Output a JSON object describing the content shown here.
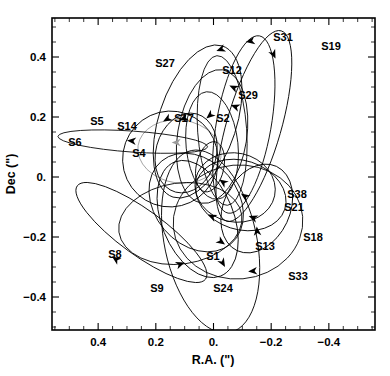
{
  "figure": {
    "type": "orbit-plot",
    "background": "#ffffff",
    "line_color": "#000000",
    "grey_line_color": "#8a8a8a"
  },
  "axes": {
    "x": {
      "label": "R.A. (\")",
      "ticks": [
        "0.4",
        "0.2",
        "0.",
        "-0.2",
        "-0.4"
      ],
      "tick_values": [
        0.4,
        0.2,
        0.0,
        -0.2,
        -0.4
      ],
      "range": [
        0.56,
        -0.56
      ],
      "reversed": true,
      "minor_tick_step": 0.05
    },
    "y": {
      "label": "Dec (\")",
      "ticks": [
        "0.4",
        "0.2",
        "0.",
        "-0.2",
        "-0.4"
      ],
      "tick_values": [
        0.4,
        0.2,
        0.0,
        -0.2,
        -0.4
      ],
      "range": [
        -0.51,
        0.53
      ],
      "minor_tick_step": 0.05
    }
  },
  "chart_data": {
    "type": "scatter",
    "title": "",
    "xlabel": "R.A. (\")",
    "ylabel": "Dec (\")",
    "xlim": [
      0.56,
      -0.56
    ],
    "ylim": [
      -0.51,
      0.53
    ],
    "grid": false,
    "legend": "none",
    "focus": {
      "ra": 0.0,
      "dec": 0.0
    },
    "orbits": [
      {
        "name": "S1",
        "cx": 0.055,
        "cy": -0.14,
        "rx": 0.125,
        "ry": 0.205,
        "rot": -22,
        "color": "#000000",
        "arrow": {
          "x": 0.02,
          "y": -0.125,
          "angle": 205
        }
      },
      {
        "name": "S2",
        "cx": 0.012,
        "cy": 0.034,
        "rx": 0.048,
        "ry": 0.085,
        "rot": 12,
        "color": "#000000",
        "arrow": {
          "x": -0.02,
          "y": -0.008,
          "angle": 215
        }
      },
      {
        "name": "S4",
        "cx": 0.118,
        "cy": 0.085,
        "rx": 0.145,
        "ry": 0.105,
        "rot": 8,
        "color": "#9a9a9a",
        "arrow": {
          "x": 0.145,
          "y": 0.115,
          "angle": 180
        }
      },
      {
        "name": "S5",
        "cx": 0.15,
        "cy": 0.06,
        "rx": 0.165,
        "ry": 0.16,
        "rot": 20,
        "color": "#000000",
        "arrow": {
          "x": 0.175,
          "y": 0.185,
          "angle": 150
        }
      },
      {
        "name": "S6",
        "cx": 0.28,
        "cy": 0.118,
        "rx": 0.26,
        "ry": 0.035,
        "rot": 4,
        "color": "#000000",
        "arrow": {
          "x": 0.3,
          "y": 0.122,
          "angle": 185
        }
      },
      {
        "name": "S8",
        "cx": 0.25,
        "cy": -0.185,
        "rx": 0.275,
        "ry": 0.075,
        "rot": 36,
        "color": "#000000",
        "arrow": {
          "x": 0.352,
          "y": -0.265,
          "angle": 215
        }
      },
      {
        "name": "S9",
        "cx": 0.115,
        "cy": -0.155,
        "rx": 0.215,
        "ry": 0.135,
        "rot": -8,
        "color": "#000000",
        "arrow": {
          "x": 0.1,
          "y": -0.285,
          "angle": 340
        }
      },
      {
        "name": "S12",
        "cx": 0.005,
        "cy": 0.135,
        "rx": 0.12,
        "ry": 0.225,
        "rot": 9,
        "color": "#000000",
        "arrow": {
          "x": -0.055,
          "y": 0.305,
          "angle": 205
        }
      },
      {
        "name": "S13",
        "cx": 0.06,
        "cy": -0.085,
        "rx": 0.145,
        "ry": 0.18,
        "rot": -40,
        "color": "#000000",
        "arrow": {
          "x": -0.04,
          "y": -0.225,
          "angle": 35
        }
      },
      {
        "name": "S14",
        "cx": 0.095,
        "cy": 0.08,
        "rx": 0.105,
        "ry": 0.135,
        "rot": 15,
        "color": "#000000",
        "arrow": {
          "x": 0.118,
          "y": 0.19,
          "angle": 160
        }
      },
      {
        "name": "S17",
        "cx": 0.005,
        "cy": 0.105,
        "rx": 0.09,
        "ry": 0.18,
        "rot": -6,
        "color": "#000000",
        "arrow": {
          "x": 0.025,
          "y": 0.195,
          "angle": 140
        }
      },
      {
        "name": "S18",
        "cx": -0.15,
        "cy": -0.105,
        "rx": 0.115,
        "ry": 0.155,
        "rot": 25,
        "color": "#000000",
        "arrow": {
          "x": -0.15,
          "y": -0.165,
          "angle": 265
        }
      },
      {
        "name": "S19",
        "cx": -0.14,
        "cy": 0.17,
        "rx": 0.095,
        "ry": 0.33,
        "rot": 16,
        "color": "#000000",
        "arrow": {
          "x": -0.215,
          "y": 0.395,
          "angle": 65
        }
      },
      {
        "name": "S21",
        "cx": -0.095,
        "cy": -0.06,
        "rx": 0.16,
        "ry": 0.115,
        "rot": 18,
        "color": "#000000",
        "arrow": {
          "x": -0.122,
          "y": -0.13,
          "angle": 200
        }
      },
      {
        "name": "S24",
        "cx": 0.01,
        "cy": -0.215,
        "rx": 0.16,
        "ry": 0.31,
        "rot": -12,
        "color": "#000000",
        "arrow": {
          "x": -0.04,
          "y": -0.3,
          "angle": 60
        }
      },
      {
        "name": "S27",
        "cx": 0.055,
        "cy": 0.185,
        "rx": 0.135,
        "ry": 0.265,
        "rot": 18,
        "color": "#000000",
        "arrow": {
          "x": -0.01,
          "y": 0.42,
          "angle": 160
        }
      },
      {
        "name": "S29",
        "cx": -0.03,
        "cy": 0.155,
        "rx": 0.085,
        "ry": 0.25,
        "rot": -4,
        "color": "#000000",
        "arrow": {
          "x": -0.06,
          "y": 0.24,
          "angle": 200
        }
      },
      {
        "name": "S31",
        "cx": -0.105,
        "cy": 0.175,
        "rx": 0.095,
        "ry": 0.3,
        "rot": 10,
        "color": "#000000",
        "arrow": {
          "x": -0.112,
          "y": 0.45,
          "angle": 170
        }
      },
      {
        "name": "S33",
        "cx": -0.085,
        "cy": -0.15,
        "rx": 0.225,
        "ry": 0.19,
        "rot": -5,
        "color": "#000000",
        "arrow": {
          "x": -0.12,
          "y": -0.315,
          "angle": 175
        }
      },
      {
        "name": "S38",
        "cx": -0.075,
        "cy": -0.035,
        "rx": 0.14,
        "ry": 0.115,
        "rot": 12,
        "color": "#000000",
        "arrow": {
          "x": -0.095,
          "y": -0.055,
          "angle": 215
        }
      }
    ],
    "labels": [
      {
        "text": "S27",
        "x": 165,
        "y": 67
      },
      {
        "text": "S12",
        "x": 232,
        "y": 74
      },
      {
        "text": "S31",
        "x": 283,
        "y": 41
      },
      {
        "text": "S19",
        "x": 331,
        "y": 50
      },
      {
        "text": "S29",
        "x": 248,
        "y": 99
      },
      {
        "text": "S5",
        "x": 97,
        "y": 125
      },
      {
        "text": "S14",
        "x": 127,
        "y": 130
      },
      {
        "text": "S17",
        "x": 184,
        "y": 122
      },
      {
        "text": "S2",
        "x": 223,
        "y": 122
      },
      {
        "text": "S6",
        "x": 75,
        "y": 146
      },
      {
        "text": "S4",
        "x": 139,
        "y": 157
      },
      {
        "text": "S38",
        "x": 297,
        "y": 198
      },
      {
        "text": "S21",
        "x": 294,
        "y": 211
      },
      {
        "text": "S18",
        "x": 313,
        "y": 241
      },
      {
        "text": "S13",
        "x": 265,
        "y": 250
      },
      {
        "text": "S8",
        "x": 115,
        "y": 258
      },
      {
        "text": "S1",
        "x": 213,
        "y": 260
      },
      {
        "text": "S33",
        "x": 298,
        "y": 280
      },
      {
        "text": "S9",
        "x": 157,
        "y": 292
      },
      {
        "text": "S24",
        "x": 223,
        "y": 292
      }
    ]
  }
}
